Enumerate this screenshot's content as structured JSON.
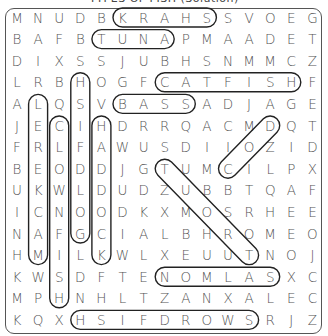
{
  "title": "TYPES OF FISH (Solution)",
  "grid": [
    [
      "M",
      "N",
      "U",
      "D",
      "B",
      "K",
      "R",
      "A",
      "H",
      "S",
      "S",
      "V",
      "O",
      "E",
      "G"
    ],
    [
      "B",
      "A",
      "F",
      "B",
      "T",
      "U",
      "N",
      "A",
      "P",
      "M",
      "A",
      "A",
      "D",
      "E",
      "T"
    ],
    [
      "D",
      "I",
      "X",
      "S",
      "S",
      "J",
      "U",
      "B",
      "H",
      "S",
      "N",
      "M",
      "M",
      "C",
      "Z"
    ],
    [
      "L",
      "R",
      "B",
      "H",
      "O",
      "G",
      "F",
      "C",
      "A",
      "T",
      "F",
      "I",
      "S",
      "H",
      "F"
    ],
    [
      "A",
      "L",
      "Q",
      "S",
      "V",
      "B",
      "A",
      "S",
      "S",
      "A",
      "D",
      "J",
      "A",
      "G",
      "E"
    ],
    [
      "J",
      "E",
      "C",
      "I",
      "H",
      "D",
      "R",
      "R",
      "Q",
      "A",
      "C",
      "M",
      "D",
      "Q",
      "T"
    ],
    [
      "F",
      "R",
      "L",
      "F",
      "A",
      "W",
      "U",
      "S",
      "D",
      "I",
      "I",
      "O",
      "Z",
      "I",
      "D"
    ],
    [
      "B",
      "E",
      "O",
      "D",
      "D",
      "J",
      "G",
      "T",
      "U",
      "M",
      "C",
      "I",
      "L",
      "P",
      "X"
    ],
    [
      "U",
      "K",
      "W",
      "L",
      "D",
      "U",
      "D",
      "Z",
      "U",
      "B",
      "B",
      "T",
      "Q",
      "A",
      "F"
    ],
    [
      "I",
      "C",
      "N",
      "O",
      "O",
      "D",
      "K",
      "X",
      "M",
      "O",
      "S",
      "R",
      "H",
      "E",
      "E"
    ],
    [
      "N",
      "A",
      "F",
      "G",
      "C",
      "I",
      "A",
      "L",
      "B",
      "H",
      "R",
      "O",
      "M",
      "E",
      "O"
    ],
    [
      "H",
      "M",
      "I",
      "L",
      "K",
      "W",
      "L",
      "X",
      "E",
      "U",
      "U",
      "T",
      "N",
      "O",
      "J"
    ],
    [
      "K",
      "W",
      "S",
      "D",
      "F",
      "T",
      "E",
      "N",
      "O",
      "M",
      "L",
      "A",
      "S",
      "X",
      "C"
    ],
    [
      "M",
      "P",
      "H",
      "N",
      "H",
      "L",
      "T",
      "Z",
      "A",
      "N",
      "X",
      "A",
      "L",
      "E",
      "C"
    ],
    [
      "K",
      "Q",
      "X",
      "H",
      "S",
      "I",
      "F",
      "D",
      "R",
      "O",
      "W",
      "S",
      "R",
      "J",
      "Z"
    ]
  ],
  "found_words": [
    {
      "word": "SHARK",
      "start": [
        0,
        9
      ],
      "end": [
        0,
        5
      ]
    },
    {
      "word": "TUNA",
      "start": [
        1,
        4
      ],
      "end": [
        1,
        7
      ]
    },
    {
      "word": "CATFISH",
      "start": [
        3,
        7
      ],
      "end": [
        3,
        13
      ]
    },
    {
      "word": "BASS",
      "start": [
        4,
        5
      ],
      "end": [
        4,
        8
      ]
    },
    {
      "word": "SALMON",
      "start": [
        12,
        12
      ],
      "end": [
        12,
        7
      ]
    },
    {
      "word": "SWORDFISH",
      "start": [
        14,
        11
      ],
      "end": [
        14,
        3
      ]
    },
    {
      "word": "MACKEREL",
      "start": [
        11,
        1
      ],
      "end": [
        4,
        1
      ]
    },
    {
      "word": "CLOWNFISH",
      "start": [
        5,
        2
      ],
      "end": [
        13,
        2
      ]
    },
    {
      "word": "GOLDFISH",
      "start": [
        10,
        3
      ],
      "end": [
        3,
        3
      ]
    },
    {
      "word": "HADDOCK",
      "start": [
        5,
        4
      ],
      "end": [
        11,
        4
      ]
    },
    {
      "word": "COD",
      "start": [
        7,
        10
      ],
      "end": [
        5,
        12
      ]
    },
    {
      "word": "TROUT",
      "start": [
        11,
        11
      ],
      "end": [
        7,
        7
      ]
    }
  ]
}
